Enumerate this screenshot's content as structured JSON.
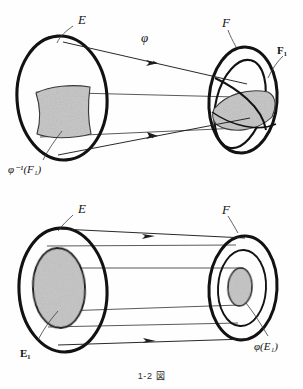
{
  "figure": {
    "caption": "1-2 図",
    "caption_number": "1-2",
    "caption_word": "図",
    "colors": {
      "ink": "#121212",
      "thin_line": "#333333",
      "shade_fill": "#c9c9c9",
      "shade_stroke": "#3a3a3a",
      "background": "#fefefe"
    },
    "top_diagram": {
      "name": "preimage-diagram",
      "description": "Left set E maps to right set F; the shaded lens region F1 inside F has preimage phi^-1(F1) shaded inside E",
      "labels": {
        "source_set": "E",
        "target_set": "F",
        "map": "φ",
        "target_subset": "F₁",
        "source_subset": "φ⁻¹(F₁)"
      },
      "arrow_count": 2
    },
    "bottom_diagram": {
      "name": "image-diagram",
      "description": "Left set E with shaded inner disc E1 maps to right set F where the image phi(E1) is a small shaded disc",
      "labels": {
        "source_set": "E",
        "target_set": "F",
        "source_subset": "E₁",
        "target_subset": "φ(E₁)"
      },
      "arrow_count": 2
    }
  }
}
